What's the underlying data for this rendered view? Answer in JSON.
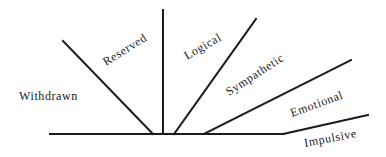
{
  "diagram": {
    "type": "fan-scale",
    "line_color": "#1c1c1c",
    "text_color": "#222222",
    "background": "#ffffff",
    "labels": [
      {
        "id": "withdrawn",
        "text": "Withdrawn"
      },
      {
        "id": "reserved",
        "text": "Reserved"
      },
      {
        "id": "logical",
        "text": "Logical"
      },
      {
        "id": "sympathetic",
        "text": "Sympathetic"
      },
      {
        "id": "emotional",
        "text": "Emotional"
      },
      {
        "id": "impulsive",
        "text": "Impulsive"
      }
    ]
  }
}
